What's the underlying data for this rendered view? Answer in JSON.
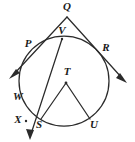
{
  "figure": {
    "type": "geometry-diagram",
    "stroke_color": "#2b2b2b",
    "background_color": "#ffffff",
    "width": 135,
    "height": 142
  },
  "circle": {
    "name": "circle-T",
    "center_label": "T",
    "cx": 64,
    "cy": 81,
    "r": 45
  },
  "labels": {
    "Q": "Q",
    "V": "V",
    "P": "P",
    "R": "R",
    "W": "W",
    "X": "X",
    "S": "S",
    "T": "T",
    "U": "U"
  },
  "points": [
    {
      "id": "Q",
      "label": "Q",
      "x": 67,
      "y": 17,
      "label_x": 67,
      "label_y": 6,
      "on_circle": false,
      "note": "external vertex where two rays meet"
    },
    {
      "id": "V",
      "label": "V",
      "x": 62,
      "y": 39,
      "label_x": 62,
      "label_y": 31,
      "on_circle": true,
      "note": "near top of circle"
    },
    {
      "id": "P",
      "label": "P",
      "x": 36,
      "y": 48,
      "label_x": 27,
      "label_y": 44,
      "on_circle": true,
      "note": "upper-left intersection"
    },
    {
      "id": "R",
      "label": "R",
      "x": 97,
      "y": 53,
      "label_x": 106,
      "label_y": 47,
      "on_circle": true,
      "note": "upper-right intersection"
    },
    {
      "id": "W",
      "label": "W",
      "x": 27,
      "y": 99,
      "label_x": 18,
      "label_y": 97,
      "on_circle": true,
      "note": "left side of circle"
    },
    {
      "id": "X",
      "label": "X",
      "x": 26,
      "y": 121,
      "label_x": 18,
      "label_y": 120,
      "on_circle": false,
      "note": "point on ray below circle"
    },
    {
      "id": "S",
      "label": "S",
      "x": 41,
      "y": 119,
      "label_x": 38,
      "label_y": 123,
      "on_circle": true,
      "note": "lower-left of circle"
    },
    {
      "id": "T",
      "label": "T",
      "x": 66,
      "y": 83,
      "label_x": 67,
      "label_y": 72,
      "on_circle": false,
      "note": "center of circle"
    },
    {
      "id": "U",
      "label": "U",
      "x": 90,
      "y": 119,
      "label_x": 93,
      "label_y": 123,
      "on_circle": true,
      "note": "lower-right of circle"
    }
  ],
  "segments": [
    {
      "name": "ray-Q-P-arrow",
      "from": "Q",
      "to": "arrow-lower-left",
      "x1": 67,
      "y1": 17,
      "x2": 12,
      "y2": 76,
      "arrow_at_end": true
    },
    {
      "name": "ray-Q-R-arrow",
      "from": "Q",
      "to": "arrow-lower-right",
      "x1": 67,
      "y1": 17,
      "x2": 124,
      "y2": 80,
      "arrow_at_end": true
    },
    {
      "name": "ray-V-W-X-arrow",
      "from": "V",
      "to": "arrow-bottom",
      "x1": 62,
      "y1": 39,
      "x2": 30,
      "y2": 137,
      "arrow_at_end": true
    },
    {
      "name": "radius-T-S",
      "from": "T",
      "to": "S",
      "x1": 66,
      "y1": 83,
      "x2": 41,
      "y2": 119,
      "arrow_at_end": false
    },
    {
      "name": "radius-T-U",
      "from": "T",
      "to": "U",
      "x1": 66,
      "y1": 83,
      "x2": 90,
      "y2": 119,
      "arrow_at_end": false
    }
  ],
  "arrowheads": [
    {
      "name": "arrowhead-lower-left",
      "x": 12,
      "y": 76,
      "angle_deg": 133
    },
    {
      "name": "arrowhead-lower-right",
      "x": 124,
      "y": 80,
      "angle_deg": 48
    },
    {
      "name": "arrowhead-bottom",
      "x": 30,
      "y": 137,
      "angle_deg": 108
    }
  ]
}
